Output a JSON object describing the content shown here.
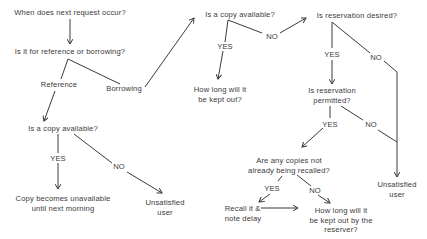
{
  "diagram": {
    "type": "decision-tree",
    "nodes": {
      "next_request": "When does next request occur?",
      "ref_or_borrow": "Is it for reference or borrowing?",
      "reference": "Reference",
      "borrowing": "Borrowing",
      "ref_copy_available": "Is a copy available?",
      "ref_yes": "YES",
      "ref_no": "NO",
      "copy_unavailable": "Copy becomes unavailable\nuntil next morning",
      "ref_unsatisfied": "Unsatisfied\nuser",
      "borrow_copy_available": "Is a copy available?",
      "borrow_yes": "YES",
      "borrow_no": "NO",
      "how_long_kept": "How long will it\nbe kept out?",
      "reservation_desired": "Is reservation desired?",
      "desired_yes": "YES",
      "desired_no": "NO",
      "reservation_permitted": "Is reservation\npermitted?",
      "permitted_yes": "YES",
      "permitted_no": "NO",
      "copies_not_recalled": "Are any copies not\nalready being recalled?",
      "recalled_yes": "YES",
      "recalled_no": "NO",
      "recall_note_delay": "Recall it &\nnote delay",
      "how_long_reserver": "How long will it\nbe kept out by the\nreserver?",
      "res_unsatisfied": "Unsatisfied\nuser"
    },
    "edges": [
      [
        "next_request",
        "ref_or_borrow",
        ""
      ],
      [
        "ref_or_borrow",
        "ref_copy_available",
        "Reference"
      ],
      [
        "ref_or_borrow",
        "borrow_copy_available",
        "Borrowing"
      ],
      [
        "ref_copy_available",
        "copy_unavailable",
        "YES"
      ],
      [
        "ref_copy_available",
        "ref_unsatisfied",
        "NO"
      ],
      [
        "borrow_copy_available",
        "how_long_kept",
        "YES"
      ],
      [
        "borrow_copy_available",
        "reservation_desired",
        "NO"
      ],
      [
        "reservation_desired",
        "reservation_permitted",
        "YES"
      ],
      [
        "reservation_desired",
        "res_unsatisfied",
        "NO"
      ],
      [
        "reservation_permitted",
        "copies_not_recalled",
        "YES"
      ],
      [
        "reservation_permitted",
        "res_unsatisfied",
        "NO"
      ],
      [
        "copies_not_recalled",
        "recall_note_delay",
        "YES"
      ],
      [
        "copies_not_recalled",
        "how_long_reserver",
        "NO"
      ],
      [
        "recall_note_delay",
        "how_long_reserver",
        ""
      ]
    ],
    "colors": {
      "ink": "#3a3a3a",
      "background": "#ffffff"
    }
  }
}
